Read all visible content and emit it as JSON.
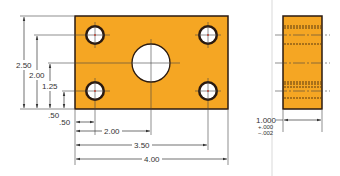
{
  "drawing": {
    "plate_color": "#f5a623",
    "outline_color": "#2a1a10",
    "hole_fill": "#ffffff",
    "dim_line_color": "#444444",
    "separator_color": "#e8e8e8"
  },
  "front_view": {
    "vertical_dimensions": {
      "overall_height": "2.50",
      "upper_hole_height": "2.00",
      "center_hole_height": "1.25",
      "lower_hole_height": ".50"
    },
    "horizontal_dimensions": {
      "lower_hole_offset": ".50",
      "center_hole_offset": "2.00",
      "right_hole_offset": "3.50",
      "overall_width": "4.00"
    }
  },
  "side_view": {
    "thickness": "1.000",
    "tolerance_plus": "+.000",
    "tolerance_minus": "−.002"
  }
}
